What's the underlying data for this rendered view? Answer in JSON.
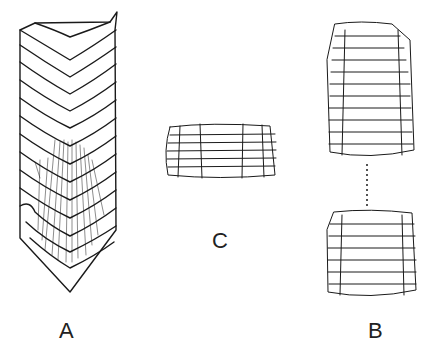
{
  "figure": {
    "panels": [
      {
        "id": "A",
        "label": "A",
        "description": "Elongated segmented rattle with chevron-shaped rings and fine hatching"
      },
      {
        "id": "C",
        "label": "C",
        "description": "Short barrel-shaped segment with hexagonal scale pattern"
      },
      {
        "id": "B",
        "label": "B",
        "description": "Two scaled segments separated by dotted line"
      }
    ],
    "colors": {
      "ink": "#1a1a1a",
      "background": "#ffffff"
    }
  }
}
